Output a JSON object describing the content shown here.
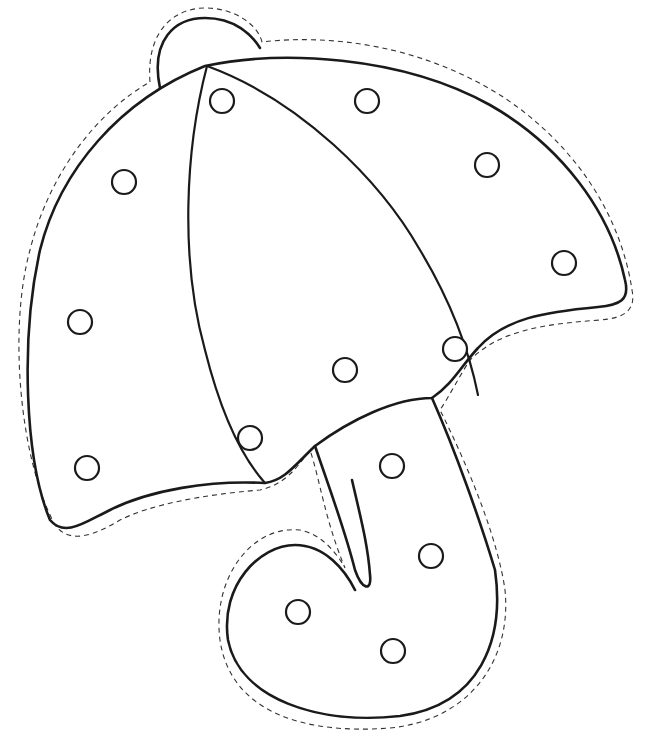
{
  "artwork": {
    "subject": "umbrella",
    "style": "black line art lacing template with dashed cut line",
    "colors": {
      "background": "#ffffff",
      "line": "#1a1a1a",
      "cut_line": "#333333"
    },
    "hole_count": 16,
    "holes": [
      {
        "x": 222,
        "y": 101
      },
      {
        "x": 367,
        "y": 101
      },
      {
        "x": 487,
        "y": 165
      },
      {
        "x": 124,
        "y": 182
      },
      {
        "x": 564,
        "y": 263
      },
      {
        "x": 80,
        "y": 322
      },
      {
        "x": 455,
        "y": 349
      },
      {
        "x": 345,
        "y": 370
      },
      {
        "x": 250,
        "y": 438
      },
      {
        "x": 87,
        "y": 468
      },
      {
        "x": 392,
        "y": 466
      },
      {
        "x": 431,
        "y": 556
      },
      {
        "x": 298,
        "y": 612
      },
      {
        "x": 393,
        "y": 651
      }
    ]
  }
}
